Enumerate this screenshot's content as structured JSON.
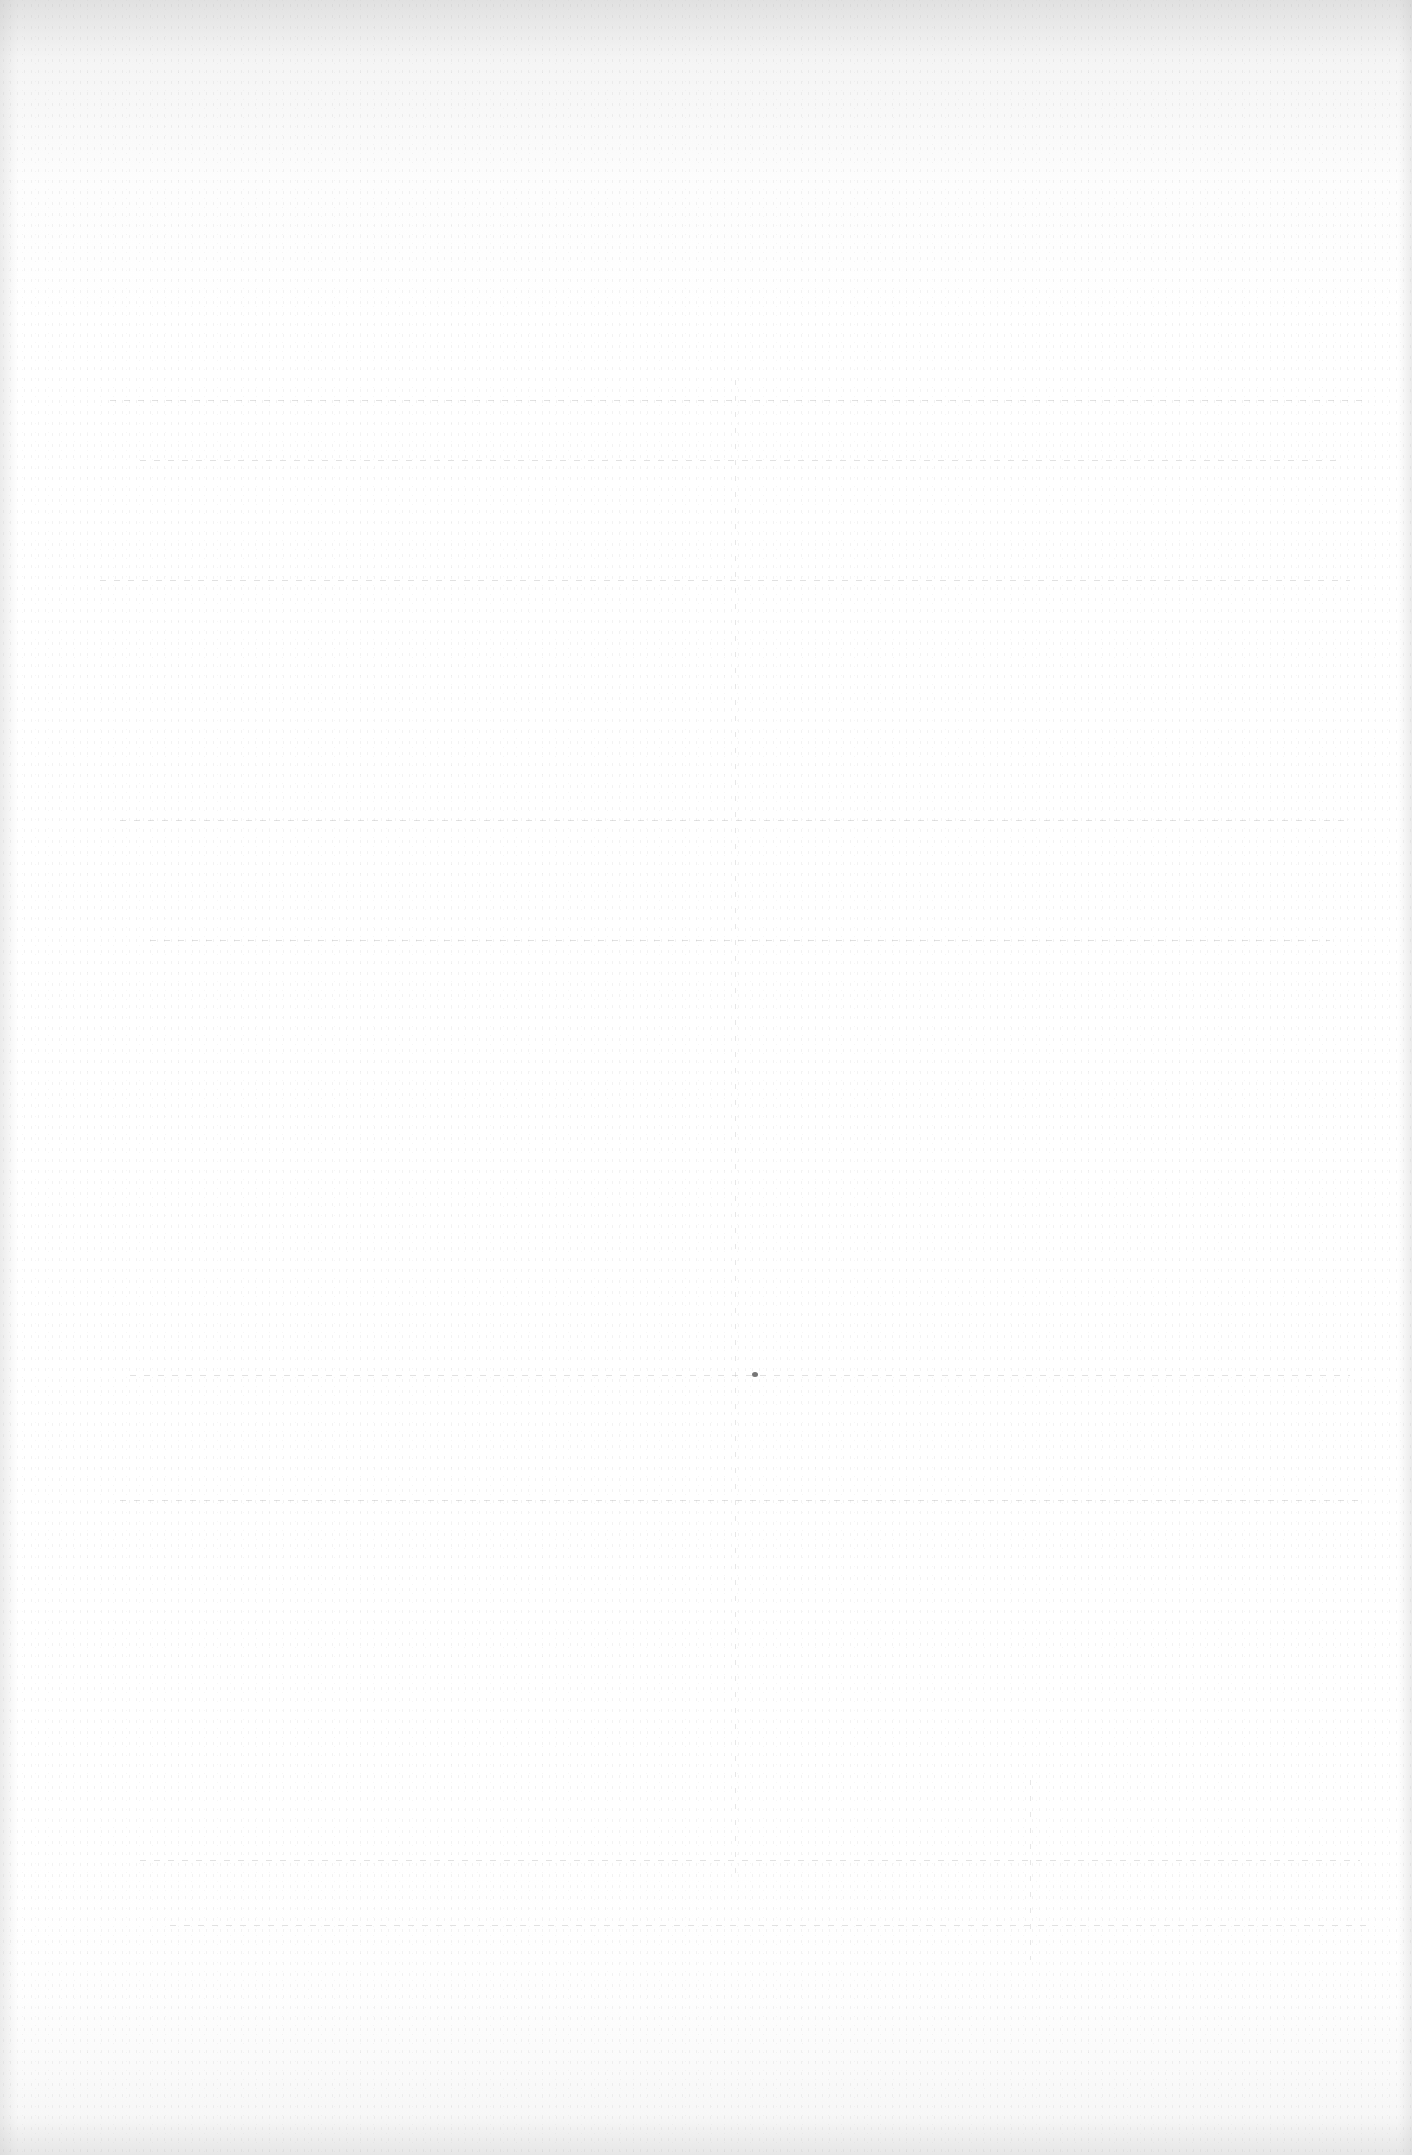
{
  "page": {
    "content_text": "",
    "background_color": "#ffffff",
    "edge_shade_color": "#d7d7d7",
    "bleed_through_line_color": "#aaaaaa",
    "speck_color": "#3c3c3c"
  },
  "bleed_through": {
    "horizontal_lines_y": [
      400,
      460,
      580,
      820,
      940,
      1375,
      1500,
      1860,
      1925
    ],
    "vertical_lines_x": [
      735,
      1030
    ]
  },
  "speck": {
    "x": 755,
    "y": 1375
  }
}
